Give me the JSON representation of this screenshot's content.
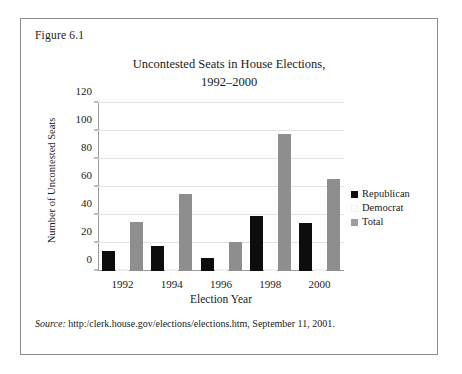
{
  "figure": {
    "number_label": "Figure 6.1",
    "source_label": "Source:",
    "source_text": "http:/clerk.house.gov/elections/elections.htm, September 11, 2001."
  },
  "chart_data": {
    "type": "bar",
    "title": "Uncontested Seats in House Elections,",
    "title_line2": "1992–2000",
    "xlabel": "Election Year",
    "ylabel": "Number of Uncontested Seats",
    "categories": [
      "1992",
      "1994",
      "1996",
      "1998",
      "2000"
    ],
    "series": [
      {
        "name": "Republican",
        "color": "#0d0d0d",
        "values": [
          14,
          18,
          9,
          39,
          34
        ]
      },
      {
        "name": "Democrat",
        "color": "#ffffff",
        "values": [
          0,
          0,
          0,
          0,
          0
        ]
      },
      {
        "name": "Total",
        "color": "#8e8e8e",
        "values": [
          35,
          55,
          21,
          98,
          66
        ]
      }
    ],
    "ylim": [
      0,
      120
    ],
    "yticks": [
      0,
      20,
      40,
      60,
      80,
      100,
      120
    ],
    "grid": true,
    "legend_position": "right"
  }
}
